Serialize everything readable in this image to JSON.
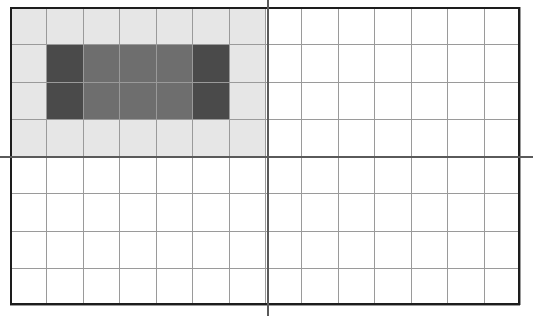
{
  "figure": {
    "type": "grid-diagram",
    "width_px": 533,
    "height_px": 316
  },
  "grid": {
    "columns": 14,
    "rows": 8,
    "left_px": 10,
    "top_px": 7,
    "right_px": 520,
    "bottom_px": 305,
    "cell_width_px": 36.43,
    "cell_height_px": 37.25,
    "line_color": "#9a9a9a",
    "border_color": "#1d1d1d",
    "background_color": "#ffffff"
  },
  "axes": {
    "x_axis": {
      "name": "horizontal-axis",
      "y_px": 157,
      "row_index": 4,
      "color": "#5a5a5a",
      "extends_full_width": true
    },
    "y_axis": {
      "name": "vertical-axis",
      "x_px": 268,
      "column_index": 7,
      "color": "#5a5a5a",
      "extends_full_height": true
    },
    "origin": {
      "x_px": 268,
      "y_px": 157
    }
  },
  "regions": [
    {
      "name": "quadrant-shading",
      "label": "second-quadrant-shading",
      "color": "#e6e6e6",
      "col_start": 0,
      "col_end": 7,
      "row_start": 0,
      "row_end": 4
    },
    {
      "name": "inner-fill-medium",
      "label": "interior-medium-gray-band",
      "color": "#6e6e6e",
      "col_start": 1,
      "col_end": 6,
      "row_start": 1,
      "row_end": 3
    },
    {
      "name": "end-cap-left",
      "label": "left-dark-column",
      "color": "#4a4a4a",
      "col_start": 1,
      "col_end": 2,
      "row_start": 1,
      "row_end": 3
    },
    {
      "name": "end-cap-right",
      "label": "right-dark-column",
      "color": "#4a4a4a",
      "col_start": 5,
      "col_end": 6,
      "row_start": 1,
      "row_end": 3
    }
  ],
  "colors": {
    "light_gray": "#e6e6e6",
    "medium_gray": "#6e6e6e",
    "dark_gray": "#4a4a4a",
    "grid_line": "#9a9a9a",
    "axis": "#5a5a5a",
    "border": "#1d1d1d",
    "white": "#ffffff"
  },
  "chart_data": {
    "type": "heatmap",
    "title": "",
    "xlabel": "",
    "ylabel": "",
    "columns": 14,
    "rows": 8,
    "legend": [],
    "grid": true,
    "cell_values": [
      [
        "e6e6e6",
        "e6e6e6",
        "e6e6e6",
        "e6e6e6",
        "e6e6e6",
        "e6e6e6",
        "e6e6e6",
        "ffffff",
        "ffffff",
        "ffffff",
        "ffffff",
        "ffffff",
        "ffffff",
        "ffffff"
      ],
      [
        "e6e6e6",
        "4a4a4a",
        "6e6e6e",
        "6e6e6e",
        "6e6e6e",
        "4a4a4a",
        "e6e6e6",
        "ffffff",
        "ffffff",
        "ffffff",
        "ffffff",
        "ffffff",
        "ffffff",
        "ffffff"
      ],
      [
        "e6e6e6",
        "4a4a4a",
        "6e6e6e",
        "6e6e6e",
        "6e6e6e",
        "4a4a4a",
        "e6e6e6",
        "ffffff",
        "ffffff",
        "ffffff",
        "ffffff",
        "ffffff",
        "ffffff",
        "ffffff"
      ],
      [
        "e6e6e6",
        "e6e6e6",
        "e6e6e6",
        "e6e6e6",
        "e6e6e6",
        "e6e6e6",
        "e6e6e6",
        "ffffff",
        "ffffff",
        "ffffff",
        "ffffff",
        "ffffff",
        "ffffff",
        "ffffff"
      ],
      [
        "ffffff",
        "ffffff",
        "ffffff",
        "ffffff",
        "ffffff",
        "ffffff",
        "ffffff",
        "ffffff",
        "ffffff",
        "ffffff",
        "ffffff",
        "ffffff",
        "ffffff",
        "ffffff"
      ],
      [
        "ffffff",
        "ffffff",
        "ffffff",
        "ffffff",
        "ffffff",
        "ffffff",
        "ffffff",
        "ffffff",
        "ffffff",
        "ffffff",
        "ffffff",
        "ffffff",
        "ffffff",
        "ffffff"
      ],
      [
        "ffffff",
        "ffffff",
        "ffffff",
        "ffffff",
        "ffffff",
        "ffffff",
        "ffffff",
        "ffffff",
        "ffffff",
        "ffffff",
        "ffffff",
        "ffffff",
        "ffffff",
        "ffffff"
      ],
      [
        "ffffff",
        "ffffff",
        "ffffff",
        "ffffff",
        "ffffff",
        "ffffff",
        "ffffff",
        "ffffff",
        "ffffff",
        "ffffff",
        "ffffff",
        "ffffff",
        "ffffff",
        "ffffff"
      ]
    ]
  }
}
